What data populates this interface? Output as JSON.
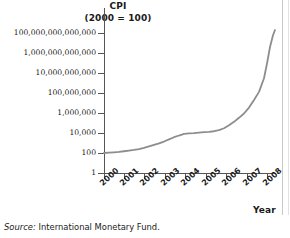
{
  "figure": {
    "title_line_1": "CPI",
    "title_line_2": "(2000 = 100)",
    "source_label": "Source:",
    "source_text": "International Monetary Fund.",
    "x_axis_title": "Year",
    "line_color": "#8d8d8d",
    "axis_color": "#555555",
    "background": "#ffffff"
  },
  "chart_data": {
    "type": "line",
    "title": "CPI (2000 = 100)",
    "xlabel": "Year",
    "ylabel": "CPI (2000 = 100)",
    "yscale": "log",
    "ylim": [
      1,
      1000000000000000
    ],
    "xlim": [
      2000,
      2008.6
    ],
    "grid": false,
    "legend": null,
    "ytick_labels": [
      "100,000,000,000,000",
      "1,000,000,000,000",
      "10,000,000,000",
      "100,000,000",
      "1,000,000",
      "10,000",
      "100",
      "1"
    ],
    "ytick_values": [
      100000000000000,
      1000000000000,
      10000000000,
      100000000,
      1000000,
      10000,
      100,
      1
    ],
    "xtick_labels": [
      "2000",
      "2001",
      "2002",
      "2003",
      "2004",
      "2005",
      "2006",
      "2007",
      "2008"
    ],
    "xtick_values": [
      2000,
      2001,
      2002,
      2003,
      2004,
      2005,
      2006,
      2007,
      2008
    ],
    "series": [
      {
        "name": "CPI",
        "x": [
          2000.0,
          2000.25,
          2000.5,
          2000.75,
          2001.0,
          2001.25,
          2001.5,
          2001.75,
          2002.0,
          2002.25,
          2002.5,
          2002.75,
          2003.0,
          2003.25,
          2003.5,
          2003.75,
          2004.0,
          2004.25,
          2004.5,
          2004.75,
          2005.0,
          2005.25,
          2005.5,
          2005.75,
          2006.0,
          2006.25,
          2006.5,
          2006.75,
          2007.0,
          2007.25,
          2007.5,
          2007.75,
          2008.0,
          2008.15,
          2008.3,
          2008.45,
          2008.55
        ],
        "y": [
          100,
          108,
          118,
          130,
          150,
          175,
          205,
          250,
          320,
          450,
          640,
          900,
          1400,
          2300,
          3800,
          5600,
          8000,
          9000,
          9800,
          11000,
          12000,
          13000,
          15000,
          19000,
          30000,
          60000,
          130000,
          330000,
          900000,
          3500000,
          20000000,
          130000000,
          3000000000,
          90000000000,
          4000000000000,
          60000000000000,
          200000000000000
        ]
      }
    ]
  }
}
